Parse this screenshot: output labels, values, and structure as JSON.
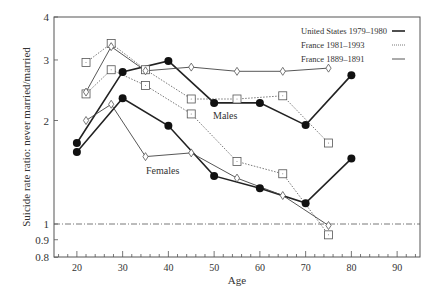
{
  "chart_data": {
    "type": "line",
    "title": "",
    "xlabel": "Age",
    "ylabel": "Suicide rate ratio: never married/married",
    "xscale": "linear",
    "yscale": "log",
    "xlim": [
      15,
      95
    ],
    "ylim": [
      0.8,
      4
    ],
    "x_ticks": [
      20,
      30,
      40,
      50,
      60,
      70,
      80,
      90
    ],
    "y_ticks": [
      0.8,
      0.9,
      1,
      2,
      3,
      4
    ],
    "y_tick_labels": [
      "0.8",
      "0.9",
      "1",
      "2",
      "3",
      "4"
    ],
    "reference_line": {
      "y": 1,
      "style": "dash-dot"
    },
    "annotations": [
      {
        "text": "Males",
        "x": 53,
        "y": 2.05
      },
      {
        "text": "Females",
        "x": 37,
        "y": 1.43
      }
    ],
    "legend": {
      "position": "upper right",
      "entries": [
        {
          "label": "United States 1979–1980",
          "style": "solid-thick",
          "marker": "filled-circle"
        },
        {
          "label": "France 1981–1993",
          "style": "dotted",
          "marker": "open-square"
        },
        {
          "label": "France 1889–1891",
          "style": "solid-thin",
          "marker": "open-diamond"
        }
      ]
    },
    "series": [
      {
        "name": "United States 1979–1980 Males",
        "group": "United States 1979–1980",
        "sex": "Males",
        "x": [
          20,
          30,
          40,
          50,
          60,
          70,
          80
        ],
        "values": [
          1.72,
          2.77,
          2.98,
          2.25,
          2.25,
          1.94,
          2.71
        ]
      },
      {
        "name": "United States 1979–1980 Females",
        "group": "United States 1979–1980",
        "sex": "Females",
        "x": [
          20,
          30,
          40,
          50,
          60,
          70,
          80
        ],
        "values": [
          1.62,
          2.32,
          1.93,
          1.38,
          1.27,
          1.15,
          1.55
        ]
      },
      {
        "name": "France 1981–1993 Males",
        "group": "France 1981–1993",
        "sex": "Males",
        "x": [
          22,
          27.5,
          35,
          45,
          55,
          65,
          75
        ],
        "values": [
          2.95,
          3.35,
          2.81,
          2.31,
          2.31,
          2.36,
          1.72
        ]
      },
      {
        "name": "France 1981–1993 Females",
        "group": "France 1981–1993",
        "sex": "Females",
        "x": [
          22,
          27.5,
          35,
          45,
          55,
          65,
          75
        ],
        "values": [
          2.39,
          2.81,
          2.53,
          2.09,
          1.52,
          1.4,
          0.93
        ]
      },
      {
        "name": "France 1889–1891 Males",
        "group": "France 1889–1891",
        "sex": "Males",
        "x": [
          22,
          27.5,
          35,
          45,
          55,
          65,
          75
        ],
        "values": [
          2.42,
          3.28,
          2.79,
          2.86,
          2.78,
          2.78,
          2.84
        ]
      },
      {
        "name": "France 1889–1891 Females",
        "group": "France 1889–1891",
        "sex": "Females",
        "x": [
          22,
          27.5,
          35,
          45,
          55,
          65,
          75
        ],
        "values": [
          2.0,
          2.23,
          1.57,
          1.61,
          1.36,
          1.21,
          0.99
        ]
      }
    ]
  },
  "labels": {
    "xlabel": "Age",
    "ylabel": "Suicide rate ratio: never married/married",
    "males": "Males",
    "females": "Females",
    "legend": [
      "United States 1979–1980",
      "France 1981–1993",
      "France 1889–1891"
    ]
  }
}
